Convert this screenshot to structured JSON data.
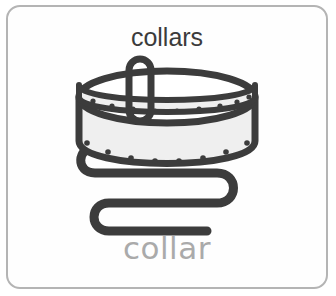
{
  "card": {
    "title": "collars",
    "caption": "collar",
    "background_color": "#fefefe",
    "border_color": "#b4b4b4",
    "title_color": "#3b3b3b",
    "caption_color": "#aaaaaa"
  },
  "illustration": {
    "name": "dog-collar-illustration",
    "outline_color": "#3c3c3c",
    "band_fill_color": "#efefef",
    "stud_color": "#3c3c3c",
    "parts": [
      {
        "name": "collar-band",
        "label": "studded collar band"
      },
      {
        "name": "buckle-loop",
        "label": "buckle loop"
      },
      {
        "name": "collar-strap",
        "label": "serpentine strap tail"
      }
    ],
    "upper_band_stud_count": 9,
    "lower_band_stud_count": 8
  }
}
